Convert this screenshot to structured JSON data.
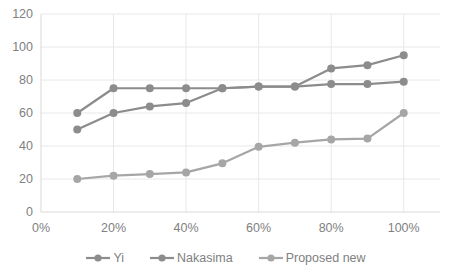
{
  "chart_data": {
    "type": "line",
    "title": "",
    "xlabel": "",
    "ylabel": "",
    "x": [
      "10%",
      "20%",
      "30%",
      "40%",
      "50%",
      "60%",
      "70%",
      "80%",
      "90%",
      "100%"
    ],
    "x_numeric": [
      10,
      20,
      30,
      40,
      50,
      60,
      70,
      80,
      90,
      100
    ],
    "series": [
      {
        "name": "Yi",
        "color": "#8c8c8c",
        "values": [
          60,
          75,
          75,
          75,
          75,
          76,
          76,
          87,
          89,
          95
        ]
      },
      {
        "name": "Nakasima",
        "color": "#8c8c8c",
        "values": [
          50,
          60,
          64,
          66,
          75,
          76,
          76,
          77.5,
          77.5,
          79
        ]
      },
      {
        "name": "Proposed new",
        "color": "#a6a6a6",
        "values": [
          20,
          22,
          23,
          24,
          29.5,
          39.5,
          42,
          44,
          44.5,
          60
        ]
      }
    ],
    "xlim": [
      0,
      110
    ],
    "ylim": [
      0,
      120
    ],
    "y_ticks": [
      0,
      20,
      40,
      60,
      80,
      100,
      120
    ],
    "y_tick_labels": [
      "0",
      "20",
      "40",
      "60",
      "80",
      "100",
      "120"
    ],
    "x_ticks": [
      0,
      20,
      40,
      60,
      80,
      100
    ],
    "x_tick_labels": [
      "0%",
      "20%",
      "40%",
      "60%",
      "80%",
      "100%"
    ],
    "grid": true,
    "grid_color": "#e8e8e8",
    "axis_color": "#d9d9d9",
    "legend_position": "bottom",
    "marker": "circle",
    "marker_size": 4
  },
  "legend": {
    "items": [
      {
        "label": "Yi",
        "color": "#8c8c8c"
      },
      {
        "label": "Nakasima",
        "color": "#8c8c8c"
      },
      {
        "label": "Proposed new",
        "color": "#a6a6a6"
      }
    ]
  }
}
